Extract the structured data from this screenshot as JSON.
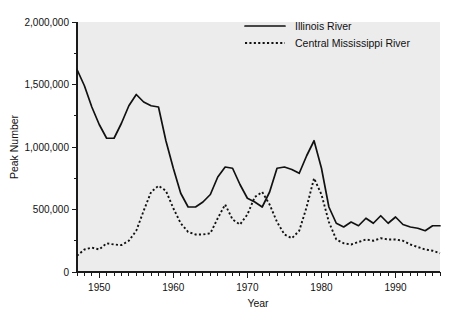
{
  "chart_data": {
    "type": "line",
    "title": "",
    "xlabel": "Year",
    "ylabel": "Peak Number",
    "xlim": [
      1947,
      1996
    ],
    "ylim": [
      0,
      2000000
    ],
    "grid": false,
    "legend_position": "top-center",
    "y_tick_labels": [
      "0",
      "500,000",
      "1,000,000",
      "1,500,000",
      "2,000,000"
    ],
    "y_tick_values": [
      0,
      500000,
      1000000,
      1500000,
      2000000
    ],
    "y_minor_tick_values": [
      250000,
      750000,
      1250000,
      1750000
    ],
    "x_tick_labels": [
      "1950",
      "1960",
      "1970",
      "1980",
      "1990"
    ],
    "x_tick_values": [
      1950,
      1960,
      1970,
      1980,
      1990
    ],
    "x_minor_tick_step": 1,
    "x": [
      1947,
      1948,
      1949,
      1950,
      1951,
      1952,
      1953,
      1954,
      1955,
      1956,
      1957,
      1958,
      1959,
      1960,
      1961,
      1962,
      1963,
      1964,
      1965,
      1966,
      1967,
      1968,
      1969,
      1970,
      1971,
      1972,
      1973,
      1974,
      1975,
      1976,
      1977,
      1978,
      1979,
      1980,
      1981,
      1982,
      1983,
      1984,
      1985,
      1986,
      1987,
      1988,
      1989,
      1990,
      1991,
      1992,
      1993,
      1994,
      1995,
      1996
    ],
    "series": [
      {
        "name": "Illinois River",
        "style": "solid",
        "color": "#111111",
        "values": [
          1620000,
          1490000,
          1320000,
          1180000,
          1070000,
          1070000,
          1190000,
          1330000,
          1420000,
          1360000,
          1330000,
          1320000,
          1050000,
          830000,
          630000,
          520000,
          520000,
          560000,
          620000,
          760000,
          840000,
          830000,
          700000,
          590000,
          560000,
          520000,
          640000,
          830000,
          840000,
          820000,
          790000,
          930000,
          1050000,
          830000,
          520000,
          390000,
          360000,
          400000,
          370000,
          430000,
          390000,
          450000,
          390000,
          440000,
          380000,
          360000,
          350000,
          330000,
          370000,
          370000
        ]
      },
      {
        "name": "Central Mississippi River",
        "style": "dotted",
        "color": "#111111",
        "values": [
          130000,
          180000,
          195000,
          180000,
          230000,
          220000,
          215000,
          250000,
          330000,
          490000,
          640000,
          690000,
          650000,
          510000,
          390000,
          320000,
          300000,
          300000,
          310000,
          430000,
          540000,
          420000,
          380000,
          460000,
          600000,
          640000,
          540000,
          400000,
          300000,
          270000,
          330000,
          520000,
          750000,
          620000,
          400000,
          260000,
          230000,
          220000,
          240000,
          260000,
          250000,
          270000,
          260000,
          260000,
          250000,
          220000,
          200000,
          180000,
          170000,
          150000
        ]
      }
    ]
  },
  "legend": {
    "entries": [
      {
        "label": "Illinois River",
        "style": "solid"
      },
      {
        "label": "Central Mississippi River",
        "style": "dotted"
      }
    ]
  }
}
